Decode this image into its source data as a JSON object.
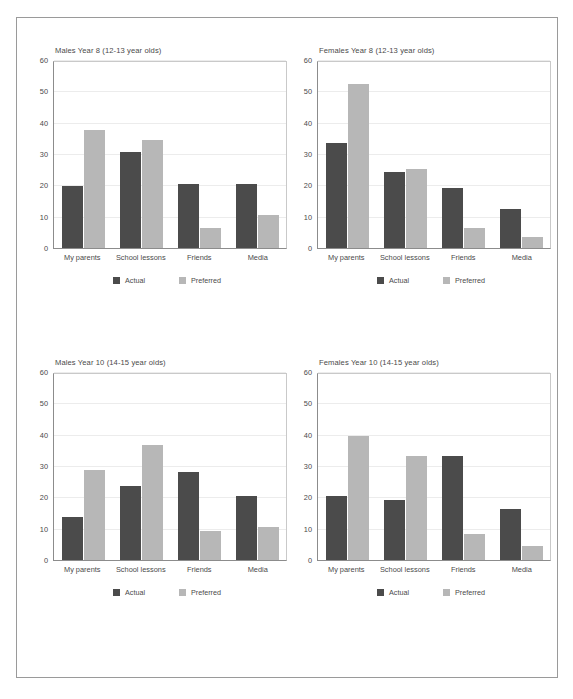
{
  "figure": {
    "name": "sources-of-information-bar-charts",
    "series_names": [
      "Actual",
      "Preferred"
    ],
    "categories": [
      "My parents",
      "School lessons",
      "Friends",
      "Media"
    ],
    "y_ticks": [
      0,
      10,
      20,
      30,
      40,
      50,
      60
    ],
    "colors": {
      "actual": "#4b4b4b",
      "preferred": "#b7b7b7",
      "axis": "#8c8c8c",
      "grid": "#ececec",
      "frame": "#9a9a9a",
      "text": "#4a4a4a"
    }
  },
  "chart_data": [
    {
      "type": "bar",
      "title": "Males Year 8 (12-13 year olds)",
      "xlabel": "",
      "ylabel": "",
      "ylim": [
        0,
        60
      ],
      "yticks": [
        0,
        10,
        20,
        30,
        40,
        50,
        60
      ],
      "grid": true,
      "legend_position": "bottom",
      "categories": [
        "My parents",
        "School lessons",
        "Friends",
        "Media"
      ],
      "series": [
        {
          "name": "Actual",
          "values": [
            20,
            31,
            20.5,
            20.5
          ]
        },
        {
          "name": "Preferred",
          "values": [
            38,
            35,
            6.5,
            10.5
          ]
        }
      ]
    },
    {
      "type": "bar",
      "title": "Females Year 8 (12-13 year olds)",
      "xlabel": "",
      "ylabel": "",
      "ylim": [
        0,
        60
      ],
      "yticks": [
        0,
        10,
        20,
        30,
        40,
        50,
        60
      ],
      "grid": true,
      "legend_position": "bottom",
      "categories": [
        "My parents",
        "School lessons",
        "Friends",
        "Media"
      ],
      "series": [
        {
          "name": "Actual",
          "values": [
            34,
            24.5,
            19.5,
            12.5
          ]
        },
        {
          "name": "Preferred",
          "values": [
            53,
            25.5,
            6.5,
            3.5
          ]
        }
      ]
    },
    {
      "type": "bar",
      "title": "Males Year 10 (14-15 year olds)",
      "xlabel": "",
      "ylabel": "",
      "ylim": [
        0,
        60
      ],
      "yticks": [
        0,
        10,
        20,
        30,
        40,
        50,
        60
      ],
      "grid": true,
      "legend_position": "bottom",
      "categories": [
        "My parents",
        "School lessons",
        "Friends",
        "Media"
      ],
      "series": [
        {
          "name": "Actual",
          "values": [
            14,
            24,
            28.5,
            20.5
          ]
        },
        {
          "name": "Preferred",
          "values": [
            29,
            37,
            9.5,
            10.5
          ]
        }
      ]
    },
    {
      "type": "bar",
      "title": "Females Year 10 (14-15 year olds)",
      "xlabel": "",
      "ylabel": "",
      "ylim": [
        0,
        60
      ],
      "yticks": [
        0,
        10,
        20,
        30,
        40,
        50,
        60
      ],
      "grid": true,
      "legend_position": "bottom",
      "categories": [
        "My parents",
        "School lessons",
        "Friends",
        "Media"
      ],
      "series": [
        {
          "name": "Actual",
          "values": [
            20.5,
            19.5,
            33.5,
            16.5
          ]
        },
        {
          "name": "Preferred",
          "values": [
            40,
            33.5,
            8.5,
            4.5
          ]
        }
      ]
    }
  ]
}
